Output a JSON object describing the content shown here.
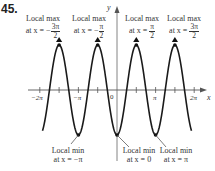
{
  "problem": {
    "number": "45."
  },
  "annotations": {
    "max": [
      {
        "title": "Local max",
        "prefix": "at x = ",
        "sign": "−",
        "num": "3π",
        "den": "2"
      },
      {
        "title": "Local max",
        "prefix": "at x = ",
        "sign": "−",
        "num": "π",
        "den": "2"
      },
      {
        "title": "Local max",
        "prefix": "at x = ",
        "sign": "",
        "num": "π",
        "den": "2"
      },
      {
        "title": "Local max",
        "prefix": "at x = ",
        "sign": "",
        "num": "3π",
        "den": "2"
      }
    ],
    "min": [
      {
        "title": "Local min",
        "text": "at x = −π"
      },
      {
        "title": "Local min",
        "text": "at x = 0"
      },
      {
        "title": "Local min",
        "text": "at x = π"
      }
    ]
  },
  "axes": {
    "x_label": "x",
    "y_label": "y"
  },
  "ticks": {
    "neg2pi": "−2π",
    "negpi": "−π",
    "zero": "0",
    "pi": "π",
    "twopi": "2π"
  },
  "chart_data": {
    "type": "line",
    "title": "",
    "function": "y = -cos(2x)",
    "xlabel": "x",
    "ylabel": "y",
    "xlim": [
      -2.1,
      2.05
    ],
    "x_units": "multiples of pi",
    "x_tick_labels": [
      "-2π",
      "-π",
      "0",
      "π",
      "2π"
    ],
    "x_tick_spacing": "π/2",
    "local_maxima_x": [
      "-3π/2",
      "-π/2",
      "π/2",
      "3π/2"
    ],
    "local_minima_x": [
      "-π",
      "0",
      "π"
    ],
    "series": [
      {
        "name": "y = -cos(2x)",
        "x_range_pi": [
          -1.93,
          1.93
        ]
      }
    ],
    "grid": false,
    "legend": "none"
  }
}
